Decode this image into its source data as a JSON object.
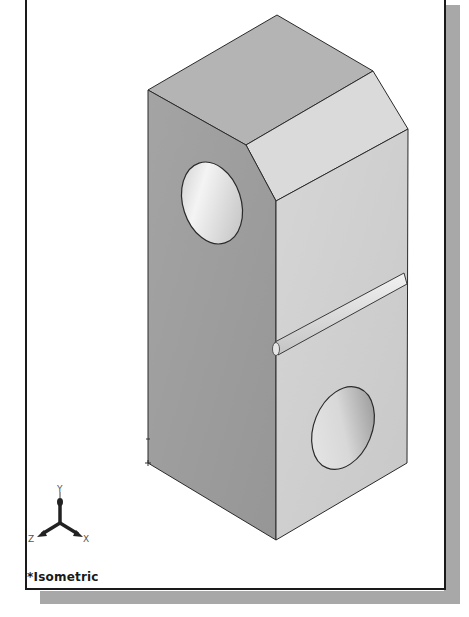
{
  "viewport": {
    "view_name": "*Isometric",
    "background": "#ffffff",
    "border_color": "#1a1a1a",
    "shadow_color": "#a8a8a8"
  },
  "model": {
    "description": "Rectangular block with chamfered top edge, two through holes and a horizontal groove",
    "face_colors": {
      "top": "#b4b4b4",
      "left": "#9c9c9c",
      "chamfer": "#dadada",
      "right": "#d0d0d0",
      "edge": "#2a2a2a"
    },
    "features": [
      "chamfer",
      "left-face-hole",
      "right-face-hole",
      "groove"
    ]
  },
  "triad": {
    "labels": {
      "x": "X",
      "y": "Y",
      "z": "Z"
    },
    "color": "#222222"
  }
}
